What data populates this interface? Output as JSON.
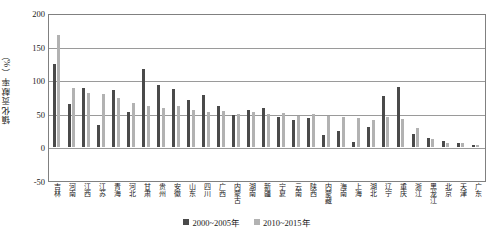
{
  "chart_data": {
    "type": "bar",
    "title": "",
    "xlabel": "",
    "ylabel": "镇化贡献率（%）",
    "ylim": [
      -50,
      200
    ],
    "yticks": [
      200,
      150,
      100,
      50,
      0,
      -50
    ],
    "ytick_labels": [
      "200",
      "150",
      "100",
      "50",
      "0",
      "-50"
    ],
    "grid": true,
    "legend_position": "bottom-center",
    "categories": [
      "吉林",
      "河南",
      "江西",
      "江苏",
      "青海",
      "河北",
      "甘肃",
      "贵州",
      "安徽",
      "山东",
      "四川",
      "广西",
      "内蒙古",
      "湖南",
      "新疆",
      "宁夏",
      "云南",
      "陕西",
      "内蒙藏",
      "海南",
      "上海",
      "湖北",
      "辽宁",
      "重庆",
      "浙江",
      "黑龙江",
      "北京",
      "天津",
      "广东"
    ],
    "series": [
      {
        "name": "2000~2005年",
        "color": "#4a4a4a",
        "values": [
          124,
          65,
          88,
          33,
          85,
          52,
          116,
          93,
          87,
          71,
          78,
          62,
          48,
          55,
          58,
          46,
          41,
          44,
          18,
          25,
          8,
          30,
          76,
          90,
          20,
          14,
          10,
          6,
          4
        ]
      },
      {
        "name": "2010~2015年",
        "color": "#b2b2b2",
        "values": [
          168,
          89,
          81,
          79,
          73,
          66,
          61,
          58,
          61,
          55,
          52,
          54,
          50,
          52,
          49,
          51,
          47,
          50,
          47,
          46,
          44,
          41,
          45,
          43,
          29,
          12,
          7,
          6,
          4
        ]
      }
    ]
  },
  "legend": {
    "items": [
      {
        "label": "2000~2005年",
        "color": "#4a4a4a"
      },
      {
        "label": "2010~2015年",
        "color": "#b2b2b2"
      }
    ]
  }
}
